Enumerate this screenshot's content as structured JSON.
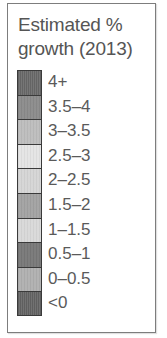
{
  "chart_data": {
    "type": "legend",
    "title": "Estimated % growth (2013)",
    "title_lines": [
      "Estimated %",
      "growth (2013)"
    ],
    "entries": [
      {
        "label": "4+",
        "color": "#6f6f6f",
        "pattern": "hatched"
      },
      {
        "label": "3.5–4",
        "color": "#8b8b8b",
        "pattern": "fine"
      },
      {
        "label": "3–3.5",
        "color": "#bdbdbd",
        "pattern": "fine"
      },
      {
        "label": "2.5–3",
        "color": "#e4e4e4",
        "pattern": "fine"
      },
      {
        "label": "2–2.5",
        "color": "#d5d5d5",
        "pattern": "fine"
      },
      {
        "label": "1.5–2",
        "color": "#a2a2a2",
        "pattern": "fine"
      },
      {
        "label": "1–1.5",
        "color": "#d9d9d9",
        "pattern": "fine"
      },
      {
        "label": "0.5–1",
        "color": "#787878",
        "pattern": "fine"
      },
      {
        "label": "0–0.5",
        "color": "#b0b0b0",
        "pattern": "fine"
      },
      {
        "label": "<0",
        "color": "#6a6a6a",
        "pattern": "hatched"
      }
    ]
  },
  "legend": {
    "title_line1": "Estimated %",
    "title_line2": "growth (2013)",
    "border_color": "#7d7d7d",
    "text_color": "#555555"
  }
}
